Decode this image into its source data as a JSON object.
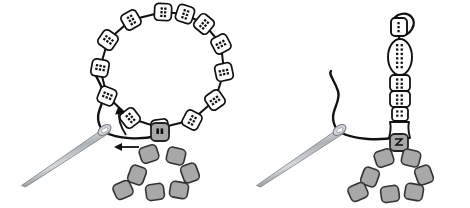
{
  "figure": {
    "type": "line-art-diagram",
    "width": 470,
    "height": 208,
    "background_color": "#ffffff",
    "panel_count": 2
  },
  "colors": {
    "outline": "#111111",
    "thread": "#111111",
    "bead_white_fill": "#ffffff",
    "bead_gray_fill": "#a8a8a8",
    "bead_gray_stroke": "#333333",
    "needle_light": "#ffffff",
    "needle_mid": "#b9bdc2",
    "needle_dark": "#6e747a",
    "hole_dot": "#111111"
  },
  "panels": [
    {
      "id": "panel-left",
      "name": "step-1-loop-of-beads",
      "needle": {
        "name": "beading-needle",
        "tip": [
          22,
          186
        ],
        "eye": [
          105,
          131
        ],
        "angle_deg": 213,
        "length_px": 99
      },
      "thread": {
        "name": "working-thread",
        "description": "S-curve tail rising from needle eye, plus horizontal thread running right to the gray anchor bead"
      },
      "arrows": [
        {
          "name": "arrow-loop-direction",
          "direction": "counterclockwise-up",
          "at": [
            121,
            112
          ]
        },
        {
          "name": "arrow-pull-direction",
          "direction": "left",
          "at": [
            120,
            148
          ]
        }
      ],
      "bead_ring": {
        "name": "white-bead-ring",
        "count": 13,
        "shape": "rounded-square",
        "fill": "#ffffff",
        "center": [
          163,
          68
        ],
        "radius_x": 42,
        "radius_y": 57,
        "positions": [
          [
            163,
            12
          ],
          [
            131,
            20
          ],
          [
            108,
            40
          ],
          [
            100,
            68
          ],
          [
            107,
            96
          ],
          [
            130,
            118
          ],
          [
            160,
            128
          ],
          [
            192,
            120
          ],
          [
            215,
            100
          ],
          [
            224,
            72
          ],
          [
            221,
            44
          ],
          [
            204,
            24
          ],
          [
            185,
            14
          ]
        ]
      },
      "anchor_bead": {
        "name": "gray-anchor-bead",
        "fill": "#a8a8a8",
        "position": [
          160,
          132
        ],
        "shape": "rounded-square"
      },
      "gray_cluster": {
        "name": "gray-seed-bead-cluster",
        "count": 7,
        "fill": "#a8a8a8",
        "arrangement": "triangle",
        "positions": [
          [
            149,
            154
          ],
          [
            176,
            156
          ],
          [
            137,
            175
          ],
          [
            190,
            173
          ],
          [
            123,
            190
          ],
          [
            155,
            192
          ],
          [
            179,
            190
          ]
        ]
      }
    },
    {
      "id": "panel-right",
      "name": "step-2-vertical-bead-stack",
      "needle": {
        "name": "beading-needle",
        "tip": [
          257,
          186
        ],
        "eye": [
          340,
          131
        ],
        "angle_deg": 213,
        "length_px": 99
      },
      "thread": {
        "name": "working-thread",
        "description": "S-curve tail rising from needle eye, plus horizontal thread running right to the gray anchor bead"
      },
      "bead_stack": {
        "name": "vertical-bead-stack",
        "beads": [
          {
            "name": "top-bead-with-thread-loop",
            "shape": "rounded-square",
            "center": [
              399,
              27
            ],
            "w": 16,
            "h": 18,
            "fill": "#ffffff"
          },
          {
            "name": "elongated-oval-bead",
            "shape": "oval",
            "center": [
              401,
              57
            ],
            "w": 24,
            "h": 36,
            "fill": "#ffffff"
          },
          {
            "name": "square-bead-3",
            "shape": "rounded-square",
            "center": [
              401,
              84
            ],
            "w": 20,
            "h": 17,
            "fill": "#ffffff"
          },
          {
            "name": "square-bead-4",
            "shape": "rounded-square",
            "center": [
              401,
              99
            ],
            "w": 20,
            "h": 16,
            "fill": "#ffffff"
          },
          {
            "name": "square-bead-5",
            "shape": "rounded-square",
            "center": [
              401,
              114
            ],
            "w": 17,
            "h": 14,
            "fill": "#ffffff"
          },
          {
            "name": "cone-bead",
            "shape": "cone",
            "center": [
              401,
              130
            ],
            "w": 22,
            "h": 16,
            "fill": "#ffffff"
          }
        ],
        "thread_loop_at_top": true
      },
      "anchor_bead": {
        "name": "gray-anchor-bead",
        "fill": "#a8a8a8",
        "position": [
          399,
          143
        ],
        "shape": "rounded-square"
      },
      "gray_cluster": {
        "name": "gray-seed-bead-cluster",
        "count": 7,
        "fill": "#a8a8a8",
        "arrangement": "triangle",
        "positions": [
          [
            384,
            158
          ],
          [
            411,
            158
          ],
          [
            370,
            177
          ],
          [
            424,
            175
          ],
          [
            358,
            192
          ],
          [
            390,
            194
          ],
          [
            414,
            192
          ]
        ]
      }
    }
  ]
}
